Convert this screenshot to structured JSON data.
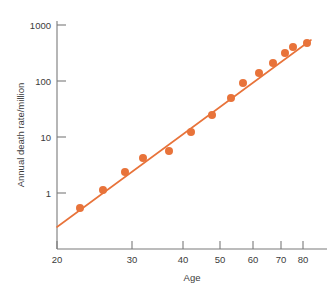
{
  "chart_data": {
    "type": "scatter",
    "title": "",
    "xlabel": "Age",
    "ylabel": "Annual death rate/million",
    "yscale": "log",
    "xscale": "nonlinear-compressed",
    "ylim": [
      0.2,
      1000
    ],
    "xlim": [
      20,
      84
    ],
    "grid": false,
    "legend": null,
    "y_tick_labels": [
      "1000",
      "100",
      "10",
      "1"
    ],
    "y_tick_values": [
      1000,
      100,
      10,
      1
    ],
    "x_tick_labels": [
      "20",
      "30",
      "40",
      "50",
      "60",
      "70",
      "80"
    ],
    "x_tick_values": [
      20,
      30,
      40,
      50,
      60,
      70,
      80
    ],
    "x_tick_pixels": [
      57,
      132,
      183,
      220,
      253,
      281,
      303
    ],
    "marker_color": "#e8733a",
    "line_color": "#e8733a",
    "axis_color": "#7a7a7a",
    "series": [
      {
        "name": "Annual death rate",
        "marker": "filled-circle",
        "x": [
          23,
          28,
          33,
          37,
          42,
          47,
          52,
          57,
          62,
          67,
          72,
          77,
          81
        ],
        "y": [
          0.55,
          1.4,
          3.4,
          6.5,
          13,
          25,
          48,
          88,
          145,
          200,
          280,
          370,
          480
        ],
        "points_px": [
          [
            80,
            208
          ],
          [
            103,
            190
          ],
          [
            125,
            172
          ],
          [
            143,
            158
          ],
          [
            169,
            151
          ],
          [
            191,
            132
          ],
          [
            212,
            115
          ],
          [
            231,
            98
          ],
          [
            243,
            83
          ],
          [
            259,
            73
          ],
          [
            273,
            63
          ],
          [
            285,
            53
          ],
          [
            293,
            47
          ],
          [
            307,
            43
          ]
        ]
      },
      {
        "name": "Fitted straight line",
        "marker": "none",
        "type": "line",
        "endpoints_px": [
          [
            57,
            227
          ],
          [
            311,
            40
          ]
        ]
      }
    ],
    "annotations": []
  },
  "figure": {
    "caption": "",
    "background": "#ffffff"
  }
}
